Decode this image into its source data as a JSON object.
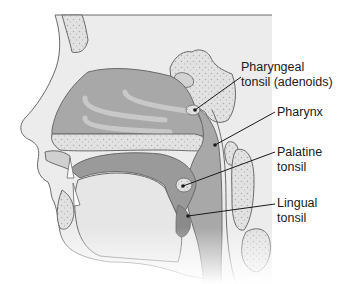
{
  "figure": {
    "colors": {
      "background": "#ffffff",
      "skin": "#ececec",
      "outline": "#6a6a6a",
      "cavity": "#a8a8a8",
      "cavity_dark": "#8f8f8f",
      "bone": "#dcdcdc",
      "bone_speckle": "#b5b5b5",
      "leader_line": "#1a1a1a"
    }
  },
  "labels": [
    {
      "id": "pharyngeal-tonsil",
      "text": "Pharyngeal\ntonsil (adenoids)",
      "x": 241,
      "y": 60,
      "pointer": [
        195,
        110
      ]
    },
    {
      "id": "pharynx",
      "text": "Pharynx",
      "x": 277,
      "y": 106,
      "pointer": [
        215,
        145
      ]
    },
    {
      "id": "palatine-tonsil",
      "text": "Palatine\ntonsil",
      "x": 277,
      "y": 146,
      "pointer": [
        183,
        186
      ]
    },
    {
      "id": "lingual-tonsil",
      "text": "Lingual\ntonsil",
      "x": 277,
      "y": 197,
      "pointer": [
        188,
        216
      ]
    }
  ]
}
